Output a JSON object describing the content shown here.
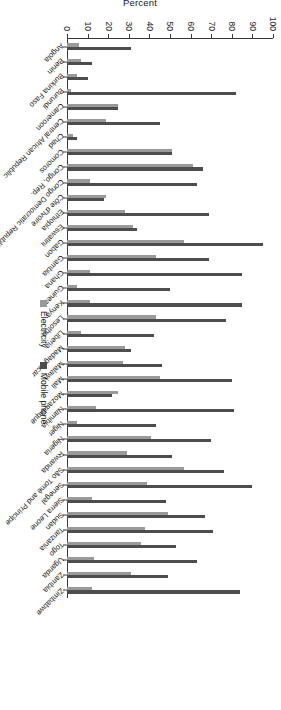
{
  "chart_data": {
    "type": "bar",
    "title": "",
    "subtitle": "",
    "xlabel": "",
    "ylabel": "Percent",
    "ylim": [
      0,
      100
    ],
    "yticks": [
      0,
      10,
      20,
      30,
      40,
      50,
      60,
      70,
      80,
      90,
      100
    ],
    "grid": false,
    "orientation": "vertical-grouped",
    "legend_position": "bottom-right",
    "colors": {
      "electricity": "#9a9a9a",
      "mobile_phone": "#4d4d4d",
      "axis": "#3a3a3a",
      "text": "#1a1a1a",
      "background": "#ffffff"
    },
    "categories": [
      "Angola",
      "Benin",
      "Burkina Faso",
      "Burundi",
      "Cameroon",
      "Central African Republic",
      "Chad",
      "Comoros",
      "Congo, Rep.",
      "Congo Democratic Republic",
      "Côte d'Ivoire",
      "Ethiopia",
      "Eswatini",
      "Gabon",
      "Gambia",
      "Ghana",
      "Guinea",
      "Kenya",
      "Lesotho",
      "Liberia",
      "Madagascar",
      "Malawi",
      "Mali",
      "Mozambique",
      "Namibia",
      "Niger",
      "Nigeria",
      "Rwanda",
      "São Tomé and Príncipe",
      "Senegal",
      "Sierra Leone",
      "Sudan",
      "Tanzania",
      "Togo",
      "Uganda",
      "Zambia",
      "Zimbabwe"
    ],
    "series": [
      {
        "name": "Electricity",
        "color": "#9a9a9a",
        "values": [
          6,
          7,
          5,
          2,
          25,
          19,
          3,
          51,
          61,
          11,
          19,
          28,
          32,
          57,
          43,
          11,
          5,
          11,
          43,
          7,
          28,
          27,
          45,
          25,
          14,
          5,
          41,
          29,
          57,
          39,
          12,
          49,
          38,
          36,
          13,
          31,
          12
        ]
      },
      {
        "name": "Mobile phone",
        "color": "#4d4d4d",
        "values": [
          31,
          12,
          10,
          82,
          25,
          45,
          5,
          51,
          66,
          63,
          18,
          69,
          34,
          95,
          69,
          85,
          50,
          85,
          77,
          42,
          31,
          46,
          80,
          22,
          81,
          43,
          70,
          51,
          76,
          90,
          48,
          67,
          71,
          53,
          63,
          49,
          84
        ]
      }
    ],
    "annotations": []
  },
  "legend": {
    "items": [
      {
        "label": "Electricity",
        "swatch": "electricity-swatch"
      },
      {
        "label": "Mobile phone",
        "swatch": "mobile-phone-swatch"
      }
    ]
  },
  "axis": {
    "value_axis_title": "Percent",
    "tick_labels": [
      "0",
      "10",
      "20",
      "30",
      "40",
      "50",
      "60",
      "70",
      "80",
      "90",
      "100"
    ]
  }
}
